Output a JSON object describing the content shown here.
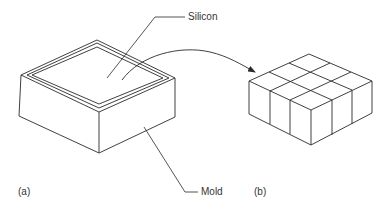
{
  "labels": {
    "silicon": "Silicon",
    "mold": "Mold",
    "panel_a": "(a)",
    "panel_b": "(b)"
  },
  "colors": {
    "stroke": "#2a2a2a",
    "text": "#333333",
    "background": "#ffffff"
  },
  "figure": {
    "panel_a": {
      "object": "mold box filled with silicon",
      "callouts": [
        "Silicon",
        "Mold"
      ]
    },
    "panel_b": {
      "object": "silicon block cut into 3x3 grid of cubes",
      "grid": [
        3,
        3
      ]
    }
  }
}
